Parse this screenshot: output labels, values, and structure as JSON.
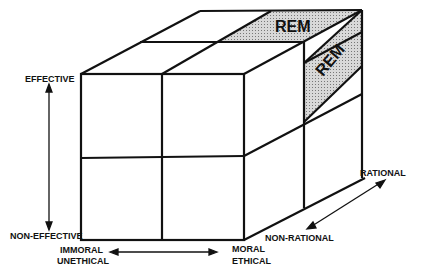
{
  "diagram": {
    "type": "3d-cube",
    "labels": {
      "effective": "EFFECTIVE",
      "non_effective": "NON-EFFECTIVE",
      "immoral": "IMMORAL",
      "unethical": "UNETHICAL",
      "moral": "MORAL",
      "ethical": "ETHICAL",
      "rational": "RATIONAL",
      "non_rational": "NON-RATIONAL"
    },
    "regions": {
      "top_rem": "REM",
      "side_rem": "REM"
    },
    "colors": {
      "line": "#111111",
      "shade": "#bdbdbd"
    }
  }
}
